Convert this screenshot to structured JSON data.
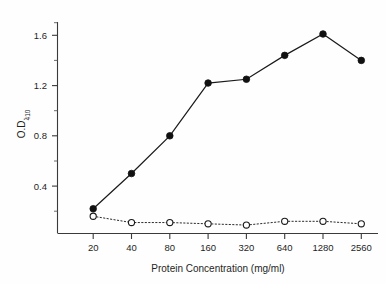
{
  "chart_data": {
    "type": "line",
    "title": "",
    "xlabel": "Protein Concentration (mg/ml)",
    "ylabel": "O.D.",
    "ylabel_subscript": "410",
    "categories": [
      "20",
      "40",
      "80",
      "160",
      "320",
      "640",
      "1280",
      "2560"
    ],
    "x_tick_labels": [
      "20",
      "40",
      "80",
      "160",
      "320",
      "640",
      "1280",
      "2560"
    ],
    "y_tick_labels": [
      "0.4",
      "0.8",
      "1.2",
      "1.6"
    ],
    "y_tick_values": [
      0.4,
      0.8,
      1.2,
      1.6
    ],
    "ylim": [
      0.02,
      1.78
    ],
    "y_minor_ticks": [
      0.2,
      0.6,
      1.0,
      1.4,
      1.8
    ],
    "grid": false,
    "legend": "none",
    "series": [
      {
        "name": "filled-circles",
        "marker": "filled-circle",
        "line_style": "solid",
        "color": "#111111",
        "values": [
          0.22,
          0.5,
          0.8,
          1.22,
          1.25,
          1.44,
          1.61,
          1.4
        ]
      },
      {
        "name": "open-circles",
        "marker": "open-circle",
        "line_style": "dotted",
        "color": "#1a1a1a",
        "values": [
          0.16,
          0.11,
          0.11,
          0.1,
          0.09,
          0.12,
          0.12,
          0.1
        ]
      }
    ]
  },
  "axes": {
    "x_axis_name": "Protein Concentration (mg/ml)",
    "y_axis_name": "O.D.410"
  }
}
